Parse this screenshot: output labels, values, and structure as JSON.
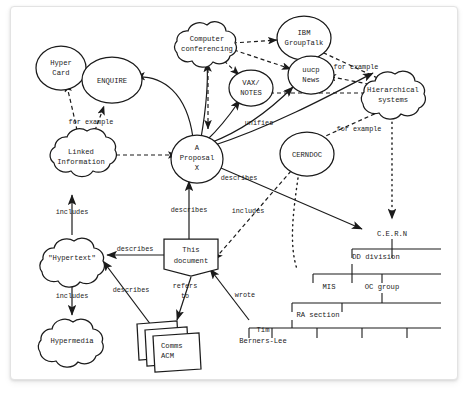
{
  "document": {
    "kind": "scanned-diagram-card",
    "background_color": "#ffffff",
    "ink_color": "#1b1b1b",
    "card_border_color": "#e3e3e3"
  },
  "nodes": {
    "hyper_card": {
      "label_lines": [
        "Hyper",
        "Card"
      ],
      "shape": "ellipse"
    },
    "enquire": {
      "label_lines": [
        "ENQUIRE"
      ],
      "shape": "ellipse"
    },
    "linked_information": {
      "label_lines": [
        "Linked",
        "Information"
      ],
      "shape": "cloud"
    },
    "hypertext": {
      "label_lines": [
        "\"Hypertext\""
      ],
      "shape": "cloud"
    },
    "hypermedia": {
      "label_lines": [
        "Hypermedia"
      ],
      "shape": "cloud"
    },
    "computer_conferencing": {
      "label_lines": [
        "Computer",
        "conferencing"
      ],
      "shape": "cloud"
    },
    "ibm_grouptalk": {
      "label_lines": [
        "IBM",
        "GroupTalk"
      ],
      "shape": "ellipse"
    },
    "uucp_news": {
      "label_lines": [
        "uucp",
        "News"
      ],
      "shape": "ellipse"
    },
    "vax_notes": {
      "label_lines": [
        "VAX/",
        "NOTES"
      ],
      "shape": "ellipse"
    },
    "hierarchical_systems": {
      "label_lines": [
        "Hierarchical",
        "systems"
      ],
      "shape": "cloud"
    },
    "a_proposal_x": {
      "label_lines": [
        "A",
        "Proposal",
        "X"
      ],
      "shape": "ellipse"
    },
    "cerndoc": {
      "label_lines": [
        "CERNDOC"
      ],
      "shape": "ellipse"
    },
    "this_document": {
      "label_lines": [
        "This",
        "document"
      ],
      "shape": "flag-box"
    },
    "comms_acm": {
      "label_lines": [
        "Comms",
        "ACM"
      ],
      "stack_label": "etc",
      "shape": "paper-stack"
    },
    "tim_berners_lee": {
      "label_lines": [
        "Tim",
        "Berners-Lee"
      ],
      "shape": "text"
    }
  },
  "edge_labels": {
    "for_example_left": "for example",
    "for_example_upper_right": "for example",
    "for_example_lower_right": "for example",
    "includes_linked": "includes",
    "includes_hypermedia": "includes",
    "includes_proposal": "includes",
    "describes_hypertext": "describes",
    "describes_proposal": "describes",
    "describes_cerndoc": "describes",
    "describes_papers": "describes",
    "refers_to": "refers\nto",
    "refers_to_line1": "refers",
    "refers_to_line2": "to",
    "wrote": "wrote",
    "unifies": "unifies"
  },
  "org_tree": {
    "root": "C.E.R.N",
    "levels": [
      {
        "label": "DD division"
      },
      {
        "label": "MIS"
      },
      {
        "label": "OC group"
      },
      {
        "label": "RA section"
      }
    ]
  }
}
